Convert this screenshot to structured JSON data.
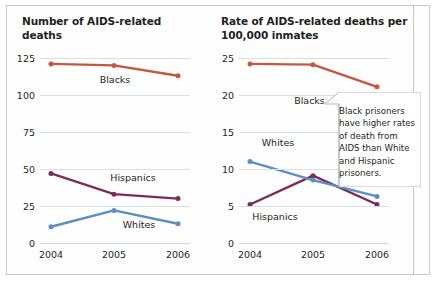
{
  "figure": {
    "width": 437,
    "height": 281,
    "background": "#ffffff",
    "frame_color": "#c9c9c4"
  },
  "colors": {
    "blacks": "#c4593f",
    "hispanics": "#7b2d58",
    "whites": "#5b8fc4",
    "gridline": "#d7dfe0",
    "text": "#231f20"
  },
  "callout": {
    "text": "Black prisoners have higher rates of death from AIDS than White and Hispanic prisoners.",
    "border_color": "#b5b5ae",
    "background": "#ffffff"
  },
  "chart_data": [
    {
      "id": "number-of-deaths",
      "type": "line",
      "title": "Number of AIDS-related deaths",
      "xlabel": "",
      "ylabel": "",
      "categories": [
        "2004",
        "2005",
        "2006"
      ],
      "x": [
        2004,
        2005,
        2006
      ],
      "ylim": [
        0,
        125
      ],
      "yticks": [
        0,
        25,
        50,
        75,
        100,
        125
      ],
      "ytick_labels": [
        "0",
        "25",
        "50",
        "75",
        "100",
        "125"
      ],
      "grid": true,
      "legend": "inline-labels",
      "series": [
        {
          "name": "Blacks",
          "color": "#c4593f",
          "values": [
            121,
            120,
            113
          ],
          "label": "Blacks"
        },
        {
          "name": "Hispanics",
          "color": "#7b2d58",
          "values": [
            47,
            33,
            30
          ],
          "label": "Hispanics"
        },
        {
          "name": "Whites",
          "color": "#5b8fc4",
          "values": [
            11,
            22,
            13
          ],
          "label": "Whites"
        }
      ]
    },
    {
      "id": "rate-per-100000-inmates",
      "type": "line",
      "title": "Rate of AIDS-related deaths per 100,000 inmates",
      "xlabel": "",
      "ylabel": "",
      "categories": [
        "2004",
        "2005",
        "2006"
      ],
      "x": [
        2004,
        2005,
        2006
      ],
      "ylim": [
        0,
        25
      ],
      "yticks": [
        0,
        5,
        10,
        15,
        20,
        25
      ],
      "ytick_labels": [
        "0",
        "5",
        "10",
        "15",
        "20",
        "25"
      ],
      "grid": true,
      "legend": "inline-labels",
      "series": [
        {
          "name": "Blacks",
          "color": "#c4593f",
          "values": [
            24.2,
            24.1,
            21.1
          ],
          "label": "Blacks"
        },
        {
          "name": "Hispanics",
          "color": "#7b2d58",
          "values": [
            5.2,
            9.1,
            5.2
          ],
          "label": "Hispanics"
        },
        {
          "name": "Whites",
          "color": "#5b8fc4",
          "values": [
            11.0,
            8.5,
            6.3
          ],
          "label": "Whites"
        }
      ]
    }
  ],
  "annotations": {
    "left_labels": [
      {
        "text": "Blacks",
        "chart": 0,
        "x_frac": 0.5,
        "y_frac": 0.115
      },
      {
        "text": "Hispanics",
        "chart": 0,
        "x_frac": 0.62,
        "y_frac": 0.645
      },
      {
        "text": "Whites",
        "chart": 0,
        "x_frac": 0.66,
        "y_frac": 0.895
      }
    ],
    "right_labels": [
      {
        "text": "Blacks",
        "chart": 1,
        "x_frac": 0.47,
        "y_frac": 0.225
      },
      {
        "text": "Whites",
        "chart": 1,
        "x_frac": 0.26,
        "y_frac": 0.455
      },
      {
        "text": "Hispanics",
        "chart": 1,
        "x_frac": 0.24,
        "y_frac": 0.855
      }
    ]
  }
}
